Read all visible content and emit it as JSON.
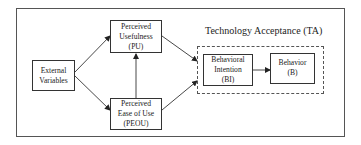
{
  "diagram": {
    "title": "Technology Acceptance (TA)",
    "nodes": {
      "ev": {
        "line1": "External",
        "line2": "Variables"
      },
      "pu": {
        "line1": "Perceived",
        "line2": "Usefulness",
        "line3": "(PU)"
      },
      "peou": {
        "line1": "Perceived",
        "line2": "Ease of Use",
        "line3": "(PEOU)"
      },
      "bi": {
        "line1": "Behavioral",
        "line2": "Intention",
        "line3": "(BI)"
      },
      "b": {
        "line1": "Behavior",
        "line2": "(B)"
      }
    },
    "edges": [
      {
        "from": "External Variables",
        "to": "Perceived Usefulness (PU)"
      },
      {
        "from": "External Variables",
        "to": "Perceived Ease of Use (PEOU)"
      },
      {
        "from": "Perceived Ease of Use (PEOU)",
        "to": "Perceived Usefulness (PU)"
      },
      {
        "from": "Perceived Usefulness (PU)",
        "to": "Technology Acceptance (TA)"
      },
      {
        "from": "Perceived Ease of Use (PEOU)",
        "to": "Technology Acceptance (TA)"
      },
      {
        "from": "Behavioral Intention (BI)",
        "to": "Behavior (B)"
      }
    ]
  }
}
